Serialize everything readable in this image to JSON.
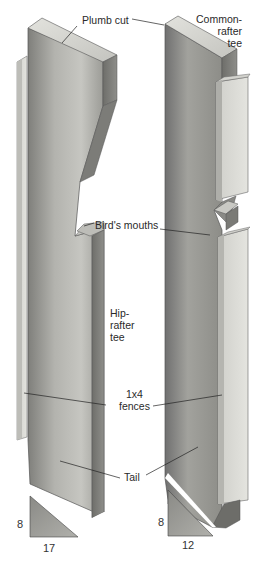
{
  "figure": {
    "colors": {
      "background": "#ffffff",
      "wood_face_dark": "#8a8a86",
      "wood_face_mid": "#a9a9a4",
      "wood_face_light": "#c9c9c4",
      "wood_top": "#d8d8d3",
      "fence_face": "#dcdcd7",
      "leader_line": "#222222",
      "text": "#2a2a2a"
    }
  },
  "labels": {
    "plumb_cut": "Plumb cut",
    "common_rafter_tee": [
      "Common-",
      "rafter",
      "tee"
    ],
    "birds_mouths": "Bird's mouths",
    "hip_rafter_tee": [
      "Hip-",
      "rafter",
      "tee"
    ],
    "fences": [
      "1x4",
      "fences"
    ],
    "tail": "Tail"
  },
  "dimensions": {
    "hip_rise": "8",
    "hip_run": "17",
    "common_rise": "8",
    "common_run": "12"
  }
}
